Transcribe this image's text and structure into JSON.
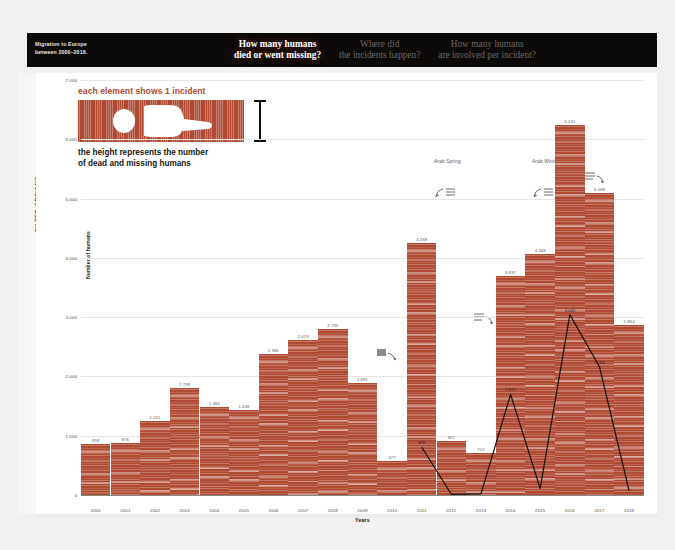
{
  "header": {
    "brand_line1": "Migration to Europe",
    "brand_line2": "between 2000–2018.",
    "nav": [
      {
        "line1": "How many humans",
        "line2": "died or went missing?",
        "active": true
      },
      {
        "line1": "Where did",
        "line2": "the incidents happen?",
        "active": false
      },
      {
        "line1": "How many humans",
        "line2": "are involved per incident?",
        "active": false
      }
    ]
  },
  "sidebar": {
    "label": "FILTER OPTIONS",
    "chevron": "›"
  },
  "legend": {
    "title": "each element shows 1 incident",
    "subtitle_line1": "the height represents the number",
    "subtitle_line2": "of dead and missing humans"
  },
  "annotations": [
    {
      "text": "Arab Spring",
      "x": 398,
      "y": 86
    },
    {
      "text": "Arab Winter",
      "x": 496,
      "y": 86
    }
  ],
  "chart_data": {
    "type": "bar",
    "title": "How many humans died or went missing?",
    "xlabel": "Years",
    "ylabel": "Number of humans",
    "ylim": [
      0,
      7000
    ],
    "yticks": [
      0,
      1000,
      2000,
      3000,
      4000,
      5000,
      6000,
      7000
    ],
    "ytick_labels": [
      "0",
      "1.000",
      "2.000",
      "3.000",
      "4.000",
      "5.000",
      "6.000",
      "7.000"
    ],
    "grid": true,
    "legend_position": "none",
    "categories": [
      "2000",
      "2001",
      "2002",
      "2003",
      "2004",
      "2005",
      "2006",
      "2007",
      "2008",
      "2009",
      "2010",
      "2011",
      "2012",
      "2013",
      "2014",
      "2015",
      "2016",
      "2017",
      "2018"
    ],
    "values": [
      858,
      876,
      1241,
      1799,
      1484,
      1438,
      2380,
      2619,
      2793,
      1891,
      577,
      4258,
      907,
      702,
      3697,
      4068,
      6241,
      5098,
      2864
    ],
    "value_labels": [
      "858",
      "876",
      "1.241",
      "1.799",
      "1.484",
      "1.438",
      "2.380",
      "2.619",
      "2.793",
      "1.891",
      "577",
      "4.258",
      "907",
      "702",
      "3.697",
      "4.068",
      "6.241",
      "5.098",
      "2.864"
    ],
    "overlay_line": {
      "name": "incidents",
      "categories": [
        "2011",
        "2012",
        "2013",
        "2014",
        "2015",
        "2016",
        "2017",
        "2018"
      ],
      "values": [
        809,
        12,
        20,
        1697,
        110,
        3043,
        2163,
        70
      ],
      "value_labels": [
        "809",
        "",
        "",
        "1.697",
        "",
        "3.043",
        "2.163",
        ""
      ]
    }
  }
}
